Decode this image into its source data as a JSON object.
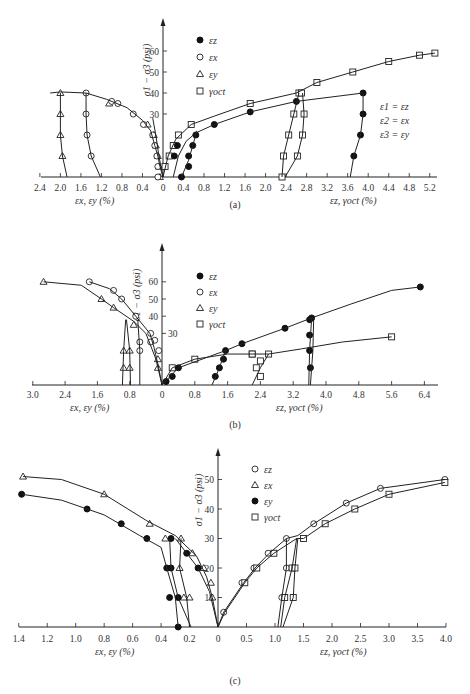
{
  "figure": {
    "panels": [
      "(a)",
      "(b)",
      "(c)"
    ]
  },
  "chart_data": [
    {
      "type": "scatter",
      "panel": "(a)",
      "caption": "(a)",
      "ylabel": "σ1 − σ3 (psi)",
      "xlabel_left": "εx, εy (%)",
      "xlabel_right": "εz, γoct (%)",
      "yticks": [
        30,
        40,
        50,
        60
      ],
      "xticks_left": [
        "2.4",
        "2.0",
        "1.6",
        "1.2",
        "0.8",
        "0.4",
        "0"
      ],
      "xticks_right": [
        "0",
        "0.4",
        "0.8",
        "1.2",
        "1.6",
        "2.0",
        "2.4",
        "2.8",
        "3.2",
        "3.6",
        "4.0",
        "4.4",
        "4.8",
        "5.2"
      ],
      "legend": [
        {
          "marker": "filled-circle",
          "label": "εz"
        },
        {
          "marker": "open-circle",
          "label": "εx"
        },
        {
          "marker": "triangle",
          "label": "εy"
        },
        {
          "marker": "square",
          "label": "γoct"
        }
      ],
      "annotation": [
        "ε1 = εz",
        "ε2 = εx",
        "ε3 = εy"
      ],
      "series": [
        {
          "name": "εy (left, negative side)",
          "marker": "triangle",
          "points": [
            [
              -0.06,
              0
            ],
            [
              -0.08,
              5
            ],
            [
              -0.1,
              10
            ],
            [
              -0.14,
              15
            ],
            [
              -0.18,
              20
            ],
            [
              -0.3,
              25
            ],
            [
              -1.05,
              35
            ],
            [
              -2.0,
              40
            ],
            [
              -2.0,
              30
            ],
            [
              -2.0,
              20
            ],
            [
              -1.96,
              10
            ]
          ]
        },
        {
          "name": "εx",
          "marker": "open-circle",
          "points": [
            [
              -0.1,
              0
            ],
            [
              -0.1,
              5
            ],
            [
              -0.12,
              10
            ],
            [
              -0.16,
              15
            ],
            [
              -0.2,
              20
            ],
            [
              -0.38,
              25
            ],
            [
              -0.58,
              30
            ],
            [
              -0.88,
              35
            ],
            [
              -1.0,
              36
            ],
            [
              -1.5,
              40
            ],
            [
              -1.5,
              30
            ],
            [
              -1.48,
              20
            ],
            [
              -1.4,
              10
            ]
          ]
        },
        {
          "name": "γoct",
          "marker": "square",
          "points": [
            [
              0.04,
              5
            ],
            [
              0.12,
              10
            ],
            [
              0.2,
              15
            ],
            [
              0.3,
              20
            ],
            [
              0.55,
              25
            ],
            [
              1.7,
              35
            ],
            [
              2.65,
              40
            ],
            [
              2.7,
              40
            ],
            [
              3.0,
              45
            ],
            [
              3.7,
              50
            ],
            [
              4.4,
              55
            ],
            [
              5.0,
              58
            ],
            [
              5.3,
              59
            ],
            [
              2.55,
              30
            ],
            [
              2.45,
              20
            ],
            [
              2.35,
              10
            ],
            [
              2.32,
              0
            ],
            [
              2.75,
              30
            ],
            [
              2.72,
              20
            ],
            [
              2.62,
              10
            ]
          ]
        },
        {
          "name": "εz",
          "marker": "filled-circle",
          "points": [
            [
              0.36,
              0
            ],
            [
              0.5,
              5
            ],
            [
              0.22,
              10
            ],
            [
              0.28,
              15
            ],
            [
              0.5,
              10
            ],
            [
              0.58,
              15
            ],
            [
              0.64,
              20
            ],
            [
              1.0,
              25
            ],
            [
              1.7,
              31
            ],
            [
              2.6,
              36
            ],
            [
              3.9,
              40
            ],
            [
              3.9,
              30
            ],
            [
              3.85,
              20
            ],
            [
              3.72,
              10
            ]
          ]
        }
      ],
      "xlim": [
        -2.4,
        5.4
      ],
      "ylim": [
        0,
        70
      ]
    },
    {
      "type": "scatter",
      "panel": "(b)",
      "caption": "(b)",
      "ylabel": "σ1 − σ3 (psi)",
      "xlabel_left": "εx, εy (%)",
      "xlabel_right": "εz, γoct (%)",
      "yticks": [
        30,
        40,
        50,
        60
      ],
      "xticks_left": [
        "3.0",
        "2.4",
        "1.6",
        "0.8",
        "0"
      ],
      "xticks_right": [
        "0",
        "0.8",
        "1.6",
        "2.4",
        "3.2",
        "4.0",
        "4.8",
        "5.6",
        "6.4"
      ],
      "legend": [
        {
          "marker": "filled-circle",
          "label": "εz"
        },
        {
          "marker": "open-circle",
          "label": "εx"
        },
        {
          "marker": "triangle",
          "label": "εy"
        },
        {
          "marker": "square",
          "label": "γoct"
        }
      ],
      "series": [
        {
          "name": "εy",
          "marker": "triangle",
          "points": [
            [
              -2.8,
              60
            ],
            [
              -1.5,
              50
            ],
            [
              -1.2,
              45
            ],
            [
              -0.7,
              35
            ],
            [
              -0.1,
              15
            ],
            [
              -0.1,
              10
            ],
            [
              -0.95,
              20
            ],
            [
              -0.95,
              10
            ],
            [
              -0.8,
              20
            ],
            [
              -0.8,
              10
            ]
          ]
        },
        {
          "name": "εx",
          "marker": "open-circle",
          "points": [
            [
              -1.8,
              60
            ],
            [
              -1.2,
              55
            ],
            [
              -1.0,
              50
            ],
            [
              -0.65,
              40
            ],
            [
              -0.28,
              30
            ],
            [
              -0.18,
              26
            ],
            [
              -0.08,
              20
            ],
            [
              -0.55,
              25
            ],
            [
              -0.55,
              20
            ],
            [
              -0.28,
              25
            ]
          ]
        },
        {
          "name": "γoct",
          "marker": "square",
          "points": [
            [
              0.25,
              10
            ],
            [
              0.8,
              15
            ],
            [
              2.2,
              18
            ],
            [
              2.2,
              18
            ],
            [
              2.6,
              18
            ],
            [
              2.4,
              14
            ],
            [
              2.3,
              10
            ],
            [
              2.4,
              5
            ],
            [
              5.6,
              28
            ]
          ]
        },
        {
          "name": "εz",
          "marker": "filled-circle",
          "points": [
            [
              0.1,
              2
            ],
            [
              0.25,
              5
            ],
            [
              0.4,
              10
            ],
            [
              1.3,
              5
            ],
            [
              1.4,
              10
            ],
            [
              1.5,
              15
            ],
            [
              1.55,
              20
            ],
            [
              1.95,
              24
            ],
            [
              3.0,
              33
            ],
            [
              3.6,
              38
            ],
            [
              3.65,
              39
            ],
            [
              3.6,
              29
            ],
            [
              3.6,
              20
            ],
            [
              3.62,
              10
            ],
            [
              6.3,
              57
            ]
          ]
        }
      ],
      "xlim": [
        -3.0,
        6.6
      ],
      "ylim": [
        0,
        70
      ]
    },
    {
      "type": "scatter",
      "panel": "(c)",
      "caption": "(c)",
      "ylabel": "σ1 − σ3 (psi)",
      "xlabel_left": "εx, εy (%)",
      "xlabel_right": "εz, γoct (%)",
      "yticks": [
        10,
        20,
        30,
        40,
        50
      ],
      "xticks_left": [
        "1.4",
        "1.2",
        "1.0",
        "0.8",
        "0.6",
        "0.4",
        "0.2",
        "0"
      ],
      "xticks_right": [
        "0",
        "0.5",
        "1.0",
        "1.5",
        "2.0",
        "2.5",
        "3.0",
        "3.5",
        "4.0"
      ],
      "legend": [
        {
          "marker": "open-circle",
          "label": "εz"
        },
        {
          "marker": "triangle",
          "label": "εx"
        },
        {
          "marker": "filled-circle",
          "label": "εy"
        },
        {
          "marker": "square",
          "label": "γoct"
        }
      ],
      "series": [
        {
          "name": "εx",
          "marker": "triangle",
          "points": [
            [
              -1.37,
              51
            ],
            [
              -0.8,
              45
            ],
            [
              -0.48,
              35
            ],
            [
              -0.37,
              30
            ],
            [
              -0.26,
              30
            ],
            [
              -0.1,
              20
            ],
            [
              -0.05,
              15
            ],
            [
              -0.04,
              10
            ],
            [
              -0.27,
              20
            ],
            [
              -0.2,
              10
            ],
            [
              -0.24,
              10
            ],
            [
              -0.18,
              25
            ]
          ]
        },
        {
          "name": "εy",
          "marker": "filled-circle",
          "points": [
            [
              -1.38,
              45
            ],
            [
              -0.92,
              40
            ],
            [
              -0.68,
              35
            ],
            [
              -0.5,
              30
            ],
            [
              -0.33,
              30
            ],
            [
              -0.22,
              25
            ],
            [
              -0.14,
              20
            ],
            [
              -0.36,
              20
            ],
            [
              -0.33,
              20
            ],
            [
              -0.34,
              10
            ],
            [
              -0.28,
              10
            ],
            [
              -0.28,
              0
            ]
          ]
        },
        {
          "name": "εz",
          "marker": "open-circle",
          "points": [
            [
              0.1,
              5
            ],
            [
              0.42,
              15
            ],
            [
              0.63,
              20
            ],
            [
              0.88,
              25
            ],
            [
              1.2,
              30
            ],
            [
              1.2,
              20
            ],
            [
              1.12,
              10
            ],
            [
              1.68,
              35
            ],
            [
              2.25,
              42
            ],
            [
              2.85,
              47
            ],
            [
              3.98,
              50
            ]
          ]
        },
        {
          "name": "γoct",
          "marker": "square",
          "points": [
            [
              0.47,
              15
            ],
            [
              0.68,
              20
            ],
            [
              0.98,
              25
            ],
            [
              1.5,
              30
            ],
            [
              1.3,
              20
            ],
            [
              1.32,
              10
            ],
            [
              1.17,
              10
            ],
            [
              1.35,
              20
            ],
            [
              1.88,
              35
            ],
            [
              2.4,
              40
            ],
            [
              3.0,
              45
            ],
            [
              3.98,
              49
            ]
          ]
        }
      ],
      "xlim": [
        -1.4,
        4.0
      ],
      "ylim": [
        0,
        55
      ]
    }
  ]
}
